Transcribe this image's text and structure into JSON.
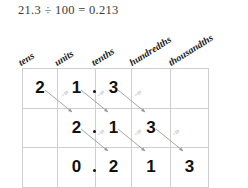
{
  "equation": "21.3 ÷ 100 = 0.213",
  "headers": [
    {
      "label": "tens",
      "name": "column-header-tens"
    },
    {
      "label": "units",
      "name": "column-header-units"
    },
    {
      "label": "tenths",
      "name": "column-header-tenths"
    },
    {
      "label": "hundredths",
      "name": "column-header-hundredths"
    },
    {
      "label": "thousandths",
      "name": "column-header-thousandths"
    }
  ],
  "rows": [
    {
      "name": "row-original-number",
      "cells": [
        {
          "digit": "2",
          "col": "tens",
          "decimal_point": false
        },
        {
          "digit": "1",
          "col": "units",
          "decimal_point": false
        },
        {
          "digit": "3",
          "col": "tenths",
          "decimal_point": true
        },
        {
          "digit": "",
          "col": "hundredths",
          "decimal_point": false
        },
        {
          "digit": "",
          "col": "thousandths",
          "decimal_point": false
        }
      ]
    },
    {
      "name": "row-divided-by-ten",
      "cells": [
        {
          "digit": "",
          "col": "tens",
          "decimal_point": false
        },
        {
          "digit": "2",
          "col": "units",
          "decimal_point": false
        },
        {
          "digit": "1",
          "col": "tenths",
          "decimal_point": true
        },
        {
          "digit": "3",
          "col": "hundredths",
          "decimal_point": false
        },
        {
          "digit": "",
          "col": "thousandths",
          "decimal_point": false
        }
      ]
    },
    {
      "name": "row-divided-by-hundred",
      "cells": [
        {
          "digit": "",
          "col": "tens",
          "decimal_point": false
        },
        {
          "digit": "0",
          "col": "units",
          "decimal_point": false
        },
        {
          "digit": "2",
          "col": "tenths",
          "decimal_point": true
        },
        {
          "digit": "1",
          "col": "hundredths",
          "decimal_point": false
        },
        {
          "digit": "3",
          "col": "thousandths",
          "decimal_point": false
        }
      ]
    }
  ],
  "arrow_label": "÷10",
  "arrows": [
    {
      "name": "arrow-tens-to-units",
      "x1": 45,
      "y1": 90,
      "x2": 72,
      "y2": 112,
      "lx": 63,
      "ly": 97
    },
    {
      "name": "arrow-units-to-tenths",
      "x1": 81,
      "y1": 90,
      "x2": 108,
      "y2": 112,
      "lx": 99,
      "ly": 97
    },
    {
      "name": "arrow-tenths-to-hundredths",
      "x1": 118,
      "y1": 90,
      "x2": 145,
      "y2": 112,
      "lx": 136,
      "ly": 97
    },
    {
      "name": "arrow-units-to-tenths-2",
      "x1": 81,
      "y1": 129,
      "x2": 108,
      "y2": 151,
      "lx": 99,
      "ly": 136
    },
    {
      "name": "arrow-tenths-to-hundredths-2",
      "x1": 118,
      "y1": 129,
      "x2": 145,
      "y2": 151,
      "lx": 136,
      "ly": 136
    },
    {
      "name": "arrow-hundredths-to-thousandths",
      "x1": 156,
      "y1": 129,
      "x2": 183,
      "y2": 151,
      "lx": 174,
      "ly": 136
    }
  ],
  "colors": {
    "grid_line": "#cfcfcf",
    "digit": "#111111",
    "equation_text": "#3a3a3a",
    "arrow": "#9a9a9a",
    "header_text": "#1a1a1a"
  }
}
